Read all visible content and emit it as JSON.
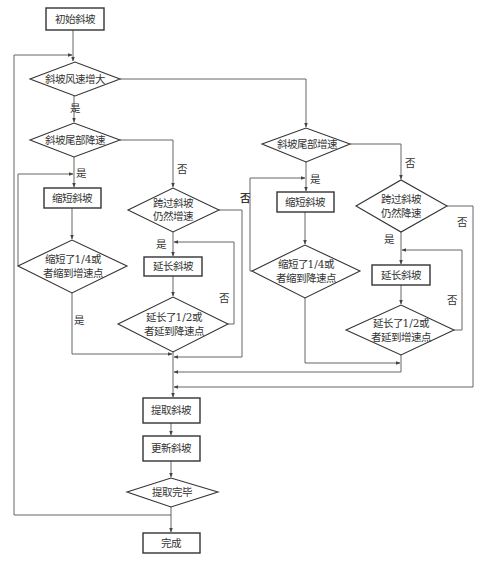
{
  "colors": {
    "stroke": "#333333",
    "edge": "#555555",
    "text": "#333333",
    "background": "#ffffff"
  },
  "nodes": {
    "start": {
      "type": "process",
      "label": "初始斜坡"
    },
    "wind_increase": {
      "type": "decision",
      "label": "斜坡风速增大"
    },
    "tail_decel": {
      "type": "decision",
      "label": "斜坡尾部降速"
    },
    "shorten_left": {
      "type": "process",
      "label": "缩短斜坡"
    },
    "shorten_check_left": {
      "type": "decision",
      "line1": "缩短了1/4或",
      "line2": "者缩到增速点"
    },
    "cross_still_accel": {
      "type": "decision",
      "line1": "跨过斜坡",
      "line2": "仍然增速"
    },
    "extend_left": {
      "type": "process",
      "label": "延长斜坡"
    },
    "extend_check_left": {
      "type": "decision",
      "line1": "延长了1/2或",
      "line2": "者延到降速点"
    },
    "tail_accel": {
      "type": "decision",
      "label": "斜坡尾部增速"
    },
    "shorten_right": {
      "type": "process",
      "label": "缩短斜坡"
    },
    "shorten_check_right": {
      "type": "decision",
      "line1": "缩短了1/4或",
      "line2": "者缩到降速点"
    },
    "cross_still_decel": {
      "type": "decision",
      "line1": "跨过斜坡",
      "line2": "仍然降速"
    },
    "extend_right": {
      "type": "process",
      "label": "延长斜坡"
    },
    "extend_check_right": {
      "type": "decision",
      "line1": "延长了1/2或",
      "line2": "者延到增速点"
    },
    "extract": {
      "type": "process",
      "label": "提取斜坡"
    },
    "update": {
      "type": "process",
      "label": "更新斜坡"
    },
    "extract_done": {
      "type": "decision",
      "label": "提取完毕"
    },
    "finish": {
      "type": "process",
      "label": "完成"
    }
  },
  "edge_labels": {
    "yes": "是",
    "no": "否"
  },
  "edges": [
    {
      "from": "start",
      "to": "wind_increase"
    },
    {
      "from": "wind_increase",
      "to": "tail_decel",
      "label": "是"
    },
    {
      "from": "wind_increase",
      "to": "tail_accel",
      "label": ""
    },
    {
      "from": "tail_decel",
      "to": "shorten_left",
      "label": "是"
    },
    {
      "from": "tail_decel",
      "to": "cross_still_accel",
      "label": "否"
    },
    {
      "from": "shorten_left",
      "to": "shorten_check_left"
    },
    {
      "from": "shorten_check_left",
      "to": "shorten_left",
      "label": ""
    },
    {
      "from": "shorten_check_left",
      "to": "extract",
      "label": "是"
    },
    {
      "from": "cross_still_accel",
      "to": "extend_left",
      "label": "是"
    },
    {
      "from": "cross_still_accel",
      "to": "extract",
      "label": "否"
    },
    {
      "from": "extend_left",
      "to": "extend_check_left"
    },
    {
      "from": "extend_check_left",
      "to": "extend_left",
      "label": "否"
    },
    {
      "from": "extend_check_left",
      "to": "extract"
    },
    {
      "from": "tail_accel",
      "to": "shorten_right",
      "label": "是"
    },
    {
      "from": "tail_accel",
      "to": "cross_still_decel",
      "label": "否"
    },
    {
      "from": "shorten_right",
      "to": "shorten_check_right"
    },
    {
      "from": "shorten_check_right",
      "to": "shorten_right",
      "label": "否"
    },
    {
      "from": "shorten_check_right",
      "to": "extract"
    },
    {
      "from": "cross_still_decel",
      "to": "extend_right",
      "label": "是"
    },
    {
      "from": "cross_still_decel",
      "to": "extract",
      "label": "否"
    },
    {
      "from": "extend_right",
      "to": "extend_check_right"
    },
    {
      "from": "extend_check_right",
      "to": "extend_right",
      "label": "否"
    },
    {
      "from": "extend_check_right",
      "to": "extract"
    },
    {
      "from": "extract",
      "to": "update"
    },
    {
      "from": "update",
      "to": "extract_done"
    },
    {
      "from": "extract_done",
      "to": "wind_increase",
      "label": ""
    },
    {
      "from": "extract_done",
      "to": "finish"
    }
  ]
}
